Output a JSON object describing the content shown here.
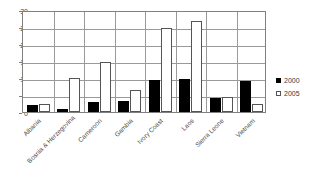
{
  "chart_data": {
    "type": "bar",
    "title": "",
    "xlabel": "",
    "ylabel": "",
    "ylim": [
      0,
      30
    ],
    "yticks": [
      0,
      5,
      10,
      15,
      20,
      25,
      30
    ],
    "grid": true,
    "legend_position": "right",
    "categories": [
      "Albania",
      "Bosnia & Herzegovina",
      "Cameroon",
      "Gambia",
      "Ivory Coast",
      "Laos",
      "Sierra Leone",
      "Vietnam"
    ],
    "series": [
      {
        "name": "2000",
        "color": "#000000",
        "values": [
          2.0,
          0.9,
          3.0,
          3.1,
          9.3,
          9.6,
          4.2,
          9.0
        ]
      },
      {
        "name": "2005",
        "color": "#ffffff",
        "values": [
          2.5,
          10.0,
          14.8,
          6.6,
          24.6,
          26.9,
          4.4,
          2.5
        ]
      }
    ]
  },
  "legend": {
    "items": [
      {
        "label": "2000",
        "swatch": "filled-square-icon"
      },
      {
        "label": "2005",
        "swatch": "hollow-square-icon"
      }
    ]
  },
  "axis": {
    "y_tick_labels": [
      "30",
      "25",
      "20",
      "15",
      "10",
      "5",
      "0"
    ]
  }
}
